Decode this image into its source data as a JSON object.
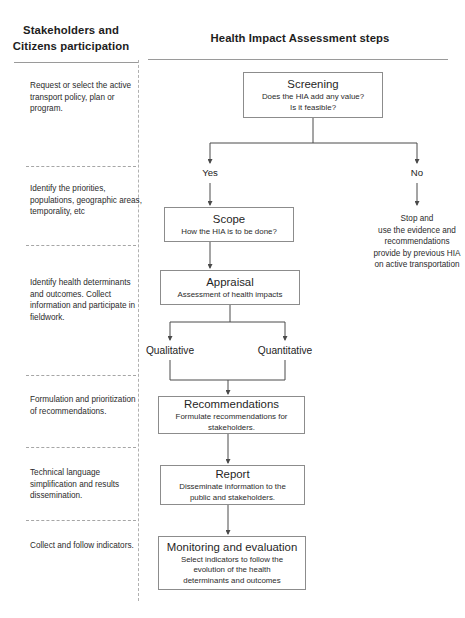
{
  "columns": {
    "left": {
      "header": "Stakeholders and Citizens participation",
      "notes": [
        "Request or select the active transport policy, plan or program.",
        "Identify the priorities, populations, geographic areas, temporality, etc",
        "Identify health determinants and outcomes. Collect information and participate in fieldwork.",
        "Formulation and prioritization of recommendations.",
        "Technical language simplification and results dissemination.",
        "Collect  and follow indicators."
      ]
    },
    "right": {
      "header": "Health Impact Assessment steps"
    }
  },
  "flow": {
    "screening": {
      "title": "Screening",
      "sub_line1": "Does the HIA add any value?",
      "sub_line2": "Is it feasible?"
    },
    "branch_yes": "Yes",
    "branch_no": "No",
    "stop_note": {
      "line1": "Stop and",
      "line2": "use  the evidence and",
      "line3": "recommendations",
      "line4": "provide by previous HIA",
      "line5": "on active transportation"
    },
    "scope": {
      "title": "Scope",
      "sub_line1": "How the HIA is to be done?"
    },
    "appraisal": {
      "title": "Appraisal",
      "sub_line1": "Assessment of health impacts"
    },
    "qualitative": "Qualitative",
    "quantitative": "Quantitative",
    "recommendations": {
      "title": "Recommendations",
      "sub_line1": "Formulate recommendations for",
      "sub_line2": "stakeholders."
    },
    "report": {
      "title": "Report",
      "sub_line1": "Disseminate information to the",
      "sub_line2": "public and stakeholders."
    },
    "monitoring": {
      "title": "Monitoring and evaluation",
      "sub_line1": "Select  indicators to follow the",
      "sub_line2": "evolution of the health",
      "sub_line3": "determinants and outcomes"
    }
  },
  "caption": {
    "text": ""
  },
  "colors": {
    "box_border": "#8c8c8c",
    "rule": "#9a9a9a",
    "divider": "#b0b0b0",
    "text": "#262626"
  }
}
